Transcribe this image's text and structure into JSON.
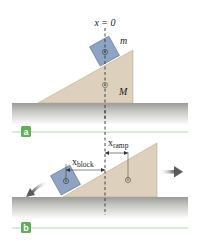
{
  "panels": [
    {
      "id": "a",
      "badge": "a",
      "origin_label": "x = 0",
      "block_label": "m",
      "ramp_label": "M"
    },
    {
      "id": "b",
      "badge": "b",
      "block_disp_label_main": "x",
      "block_disp_label_sub": "block",
      "ramp_disp_label_main": "x",
      "ramp_disp_label_sub": "ramp"
    }
  ],
  "colors": {
    "ramp": "#ddd0bd",
    "ramp_edge": "#b9a98f",
    "block": "#8fa3c4",
    "block_edge": "#5d6f8e",
    "ground_top": "#9a9a96",
    "ground_bottom": "#ffffff",
    "badge": "#5fae5a",
    "guide_line": "#9ccf98",
    "arrow": "#6b6b6b"
  },
  "icons": {
    "center_of_mass": "center-of-mass-icon",
    "arrow_left": "arrow-left-icon",
    "arrow_right": "arrow-right-icon"
  }
}
